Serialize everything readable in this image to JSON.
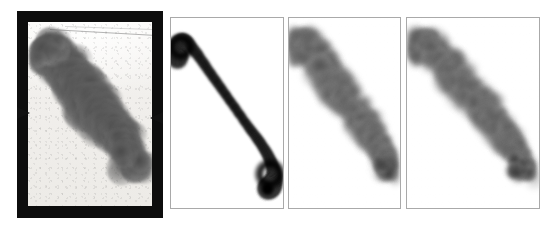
{
  "figure": {
    "kind": "flow-visualization-comparison",
    "panel_count": 4,
    "background_color": "#ffffff",
    "caption": ""
  },
  "panels": [
    {
      "id": "experiment-photograph",
      "type": "photograph",
      "label": "",
      "frame_color": "#0d0d0d",
      "plate_color": "#f2f1ee",
      "smoke_color": "#5a5a5a",
      "x": 17,
      "y": 11,
      "width": 146,
      "height": 207,
      "description": "Experimental smoke-visualization photograph of a turbulent jet in a rectangular test section, bordered by a thick black frame. Two black wedge markers mark the nozzle lips on the left and right walls at mid height.",
      "markers": [
        {
          "name": "nozzle-wedge-left",
          "side": "left",
          "y": 96
        },
        {
          "name": "nozzle-wedge-right",
          "side": "right",
          "y": 101
        }
      ]
    },
    {
      "id": "simulation-laminar",
      "type": "simulation",
      "label": "",
      "border_color": "#a9a9a9",
      "ink_color": "#000000",
      "x": 170,
      "y": 17,
      "width": 114,
      "height": 192,
      "description": "Smooth, sharply resolved S-shaped jet trajectory with a roll-up hook at the upper left and a second roll-up at the lower right; high contrast, no small-scale structure."
    },
    {
      "id": "simulation-turbulent-a",
      "type": "simulation",
      "label": "",
      "border_color": "#a9a9a9",
      "ink_color": "#4b4b4b",
      "x": 288,
      "y": 17,
      "width": 113,
      "height": 192,
      "description": "Diffuse, grainy jet with fine-scale turbulent texture following the same diagonal path; a concentrated dark vortex core sits at the lower right."
    },
    {
      "id": "simulation-turbulent-b",
      "type": "simulation",
      "label": "",
      "border_color": "#a9a9a9",
      "ink_color": "#4b4b4b",
      "x": 406,
      "y": 17,
      "width": 134,
      "height": 192,
      "description": "Second turbulent realization, slightly wider frame; similar diagonal grainy plume with a dark compact vortex core at the lower right."
    }
  ],
  "chart_data": {
    "type": "scatter",
    "title": "",
    "xlabel": "",
    "ylabel": "",
    "note": "Panel centerline trajectories expressed as fractions of each panel's width and height (0,0 = top-left of the panel interior).",
    "series": [
      {
        "name": "experiment-photograph-plume-centerline",
        "x": [
          0.14,
          0.17,
          0.22,
          0.3,
          0.38,
          0.46,
          0.54,
          0.62,
          0.7,
          0.77,
          0.82,
          0.86,
          0.88
        ],
        "y": [
          0.22,
          0.16,
          0.18,
          0.26,
          0.33,
          0.4,
          0.46,
          0.52,
          0.58,
          0.64,
          0.71,
          0.77,
          0.81
        ]
      },
      {
        "name": "simulation-laminar-centerline",
        "x": [
          0.06,
          0.06,
          0.12,
          0.22,
          0.34,
          0.46,
          0.58,
          0.7,
          0.8,
          0.88,
          0.92,
          0.9,
          0.86
        ],
        "y": [
          0.22,
          0.15,
          0.12,
          0.18,
          0.28,
          0.38,
          0.48,
          0.58,
          0.66,
          0.74,
          0.82,
          0.88,
          0.9
        ]
      },
      {
        "name": "simulation-turbulent-a-centerline",
        "x": [
          0.1,
          0.1,
          0.16,
          0.26,
          0.36,
          0.47,
          0.58,
          0.68,
          0.77,
          0.84,
          0.88,
          0.89
        ],
        "y": [
          0.2,
          0.13,
          0.13,
          0.21,
          0.3,
          0.39,
          0.48,
          0.56,
          0.64,
          0.71,
          0.77,
          0.82
        ]
      },
      {
        "name": "simulation-turbulent-b-centerline",
        "x": [
          0.1,
          0.1,
          0.16,
          0.26,
          0.36,
          0.47,
          0.58,
          0.68,
          0.77,
          0.84,
          0.88,
          0.89
        ],
        "y": [
          0.2,
          0.13,
          0.13,
          0.21,
          0.3,
          0.39,
          0.48,
          0.56,
          0.64,
          0.71,
          0.77,
          0.82
        ]
      }
    ],
    "vortex_cores": [
      {
        "panel": "experiment-photograph",
        "x": 0.84,
        "y": 0.76
      },
      {
        "panel": "simulation-laminar",
        "x": 0.88,
        "y": 0.82
      },
      {
        "panel": "simulation-turbulent-a",
        "x": 0.86,
        "y": 0.78
      },
      {
        "panel": "simulation-turbulent-b",
        "x": 0.86,
        "y": 0.78
      }
    ]
  }
}
